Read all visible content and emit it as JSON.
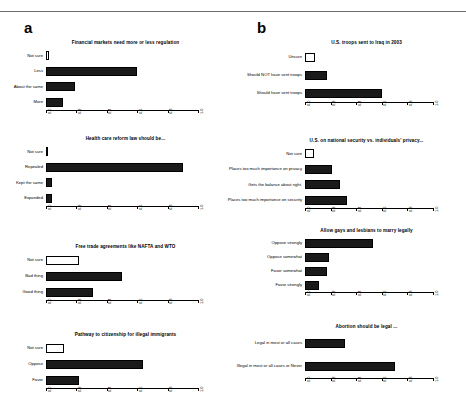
{
  "figure": {
    "panels": [
      {
        "letter": "a",
        "charts": [
          {
            "title": "Financial markets need more or less regulation",
            "categories": [
              "Not sure",
              "Less",
              "About the same",
              "More"
            ],
            "values": [
              0.02,
              0.6,
              0.19,
              0.11
            ],
            "hollow": [
              true,
              false,
              false,
              false
            ]
          },
          {
            "title": "Health care reform law should be...",
            "categories": [
              "Not sure",
              "Repealed",
              "Kept the same",
              "Expanded"
            ],
            "values": [
              0.015,
              0.9,
              0.04,
              0.04
            ],
            "hollow": [
              true,
              false,
              false,
              false
            ]
          },
          {
            "title": "Free trade agreements like NAFTA and WTO",
            "categories": [
              "Not sure",
              "Bad thing",
              "Good thing"
            ],
            "values": [
              0.22,
              0.5,
              0.31
            ],
            "hollow": [
              true,
              false,
              false
            ]
          },
          {
            "title": "Pathway to citizenship for illegal immigrants",
            "categories": [
              "Not sure",
              "Oppose",
              "Favor"
            ],
            "values": [
              0.12,
              0.64,
              0.22
            ],
            "hollow": [
              true,
              false,
              false
            ]
          }
        ]
      },
      {
        "letter": "b",
        "charts": [
          {
            "title": "U.S. troops sent to Iraq in 2003",
            "categories": [
              "Unsure",
              "Should NOT have sent troops",
              "Should have sent troops"
            ],
            "values": [
              0.075,
              0.17,
              0.6
            ],
            "hollow": [
              true,
              false,
              false
            ]
          },
          {
            "title": "U.S. on national security vs. individuals' privacy...",
            "categories": [
              "Not sure",
              "Places too much importance on privacy",
              "Gets the balance about right.",
              "Places too much importance on security"
            ],
            "values": [
              0.07,
              0.21,
              0.27,
              0.33
            ],
            "hollow": [
              true,
              false,
              false,
              false
            ]
          },
          {
            "title": "Allow gays and lesbians to marry legally",
            "categories": [
              "Oppose strongly",
              "Oppose somewhat",
              "Favor somewhat",
              "Favor strongly"
            ],
            "values": [
              0.53,
              0.19,
              0.17,
              0.11
            ],
            "hollow": [
              false,
              false,
              false,
              false
            ]
          },
          {
            "title": "Abortion should be legal ...",
            "categories": [
              "Legal in most or all cases",
              "Illegal in most or all cases or Never"
            ],
            "values": [
              0.31,
              0.7
            ],
            "hollow": [
              false,
              false
            ]
          }
        ]
      }
    ],
    "axis": {
      "ticks": [
        0.0,
        0.2,
        0.4,
        0.6,
        0.8,
        1.0
      ],
      "tick_labels": [
        "0.0",
        "0.2",
        "0.4",
        "0.6",
        "0.8",
        "1.0"
      ],
      "min": 0.0,
      "max": 1.0
    },
    "colors": {
      "bar_fill": "#1a1a1a",
      "bar_hollow": "#ffffff",
      "bar_stroke": "#000000",
      "axis": "#000000",
      "rule": "#6e6e6e"
    }
  },
  "chart_data": [
    {
      "type": "bar",
      "orientation": "horizontal",
      "panel": "a",
      "title": "Financial markets need more or less regulation",
      "categories": [
        "Not sure",
        "Less",
        "About the same",
        "More"
      ],
      "values": [
        0.02,
        0.6,
        0.19,
        0.11
      ],
      "xlabel": "",
      "ylabel": "",
      "xlim": [
        0.0,
        1.0
      ],
      "grid": false,
      "legend": "none"
    },
    {
      "type": "bar",
      "orientation": "horizontal",
      "panel": "a",
      "title": "Health care reform law should be...",
      "categories": [
        "Not sure",
        "Repealed",
        "Kept the same",
        "Expanded"
      ],
      "values": [
        0.015,
        0.9,
        0.04,
        0.04
      ],
      "xlabel": "",
      "ylabel": "",
      "xlim": [
        0.0,
        1.0
      ],
      "grid": false,
      "legend": "none"
    },
    {
      "type": "bar",
      "orientation": "horizontal",
      "panel": "a",
      "title": "Free trade agreements like NAFTA and WTO",
      "categories": [
        "Not sure",
        "Bad thing",
        "Good thing"
      ],
      "values": [
        0.22,
        0.5,
        0.31
      ],
      "xlabel": "",
      "ylabel": "",
      "xlim": [
        0.0,
        1.0
      ],
      "grid": false,
      "legend": "none"
    },
    {
      "type": "bar",
      "orientation": "horizontal",
      "panel": "a",
      "title": "Pathway to citizenship for illegal immigrants",
      "categories": [
        "Not sure",
        "Oppose",
        "Favor"
      ],
      "values": [
        0.12,
        0.64,
        0.22
      ],
      "xlabel": "",
      "ylabel": "",
      "xlim": [
        0.0,
        1.0
      ],
      "grid": false,
      "legend": "none"
    },
    {
      "type": "bar",
      "orientation": "horizontal",
      "panel": "b",
      "title": "U.S. troops sent to Iraq in 2003",
      "categories": [
        "Unsure",
        "Should NOT have sent troops",
        "Should have sent troops"
      ],
      "values": [
        0.075,
        0.17,
        0.6
      ],
      "xlabel": "",
      "ylabel": "",
      "xlim": [
        0.0,
        1.0
      ],
      "grid": false,
      "legend": "none"
    },
    {
      "type": "bar",
      "orientation": "horizontal",
      "panel": "b",
      "title": "U.S. on national security vs. individuals' privacy...",
      "categories": [
        "Not sure",
        "Places too much importance on privacy",
        "Gets the balance about right.",
        "Places too much importance on security"
      ],
      "values": [
        0.07,
        0.21,
        0.27,
        0.33
      ],
      "xlabel": "",
      "ylabel": "",
      "xlim": [
        0.0,
        1.0
      ],
      "grid": false,
      "legend": "none"
    },
    {
      "type": "bar",
      "orientation": "horizontal",
      "panel": "b",
      "title": "Allow gays and lesbians to marry legally",
      "categories": [
        "Oppose strongly",
        "Oppose somewhat",
        "Favor somewhat",
        "Favor strongly"
      ],
      "values": [
        0.53,
        0.19,
        0.17,
        0.11
      ],
      "xlabel": "",
      "ylabel": "",
      "xlim": [
        0.0,
        1.0
      ],
      "grid": false,
      "legend": "none"
    },
    {
      "type": "bar",
      "orientation": "horizontal",
      "panel": "b",
      "title": "Abortion should be legal ...",
      "categories": [
        "Legal in most or all cases",
        "Illegal in most or all cases or Never"
      ],
      "values": [
        0.31,
        0.7
      ],
      "xlabel": "",
      "ylabel": "",
      "xlim": [
        0.0,
        1.0
      ],
      "grid": false,
      "legend": "none"
    }
  ]
}
